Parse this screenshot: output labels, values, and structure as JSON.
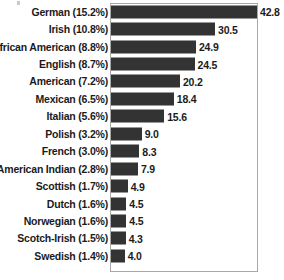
{
  "chart_data": {
    "type": "bar",
    "orientation": "horizontal",
    "title": "",
    "subtitle": "",
    "xlabel": "",
    "ylabel": "",
    "grid": false,
    "legend": null,
    "xlim": [
      0,
      43.1
    ],
    "axis_ticks": [],
    "categories": [
      "German (15.2%)",
      "Irish (10.8%)",
      "African American (8.8%)",
      "English (8.7%)",
      "American (7.2%)",
      "Mexican (6.5%)",
      "Italian (5.6%)",
      "Polish (3.2%)",
      "French (3.0%)",
      "American Indian (2.8%)",
      "Scottish (1.7%)",
      "Dutch (1.6%)",
      "Norwegian (1.6%)",
      "Scotch-Irish (1.5%)",
      "Swedish (1.4%)"
    ],
    "values": [
      42.8,
      30.5,
      24.9,
      24.5,
      20.2,
      18.4,
      15.6,
      9.0,
      8.3,
      7.9,
      4.9,
      4.5,
      4.5,
      4.3,
      4.0
    ],
    "value_labels": [
      "42.8",
      "30.5",
      "24.9",
      "24.5",
      "20.2",
      "18.4",
      "15.6",
      "9.0",
      "8.3",
      "7.9",
      "4.9",
      "4.5",
      "4.5",
      "4.3",
      "4.0"
    ],
    "bar_color": "#333333",
    "frame_color": "#a8a8a8",
    "background_color": "#ffffff",
    "text_color": "#1b1b1b"
  }
}
